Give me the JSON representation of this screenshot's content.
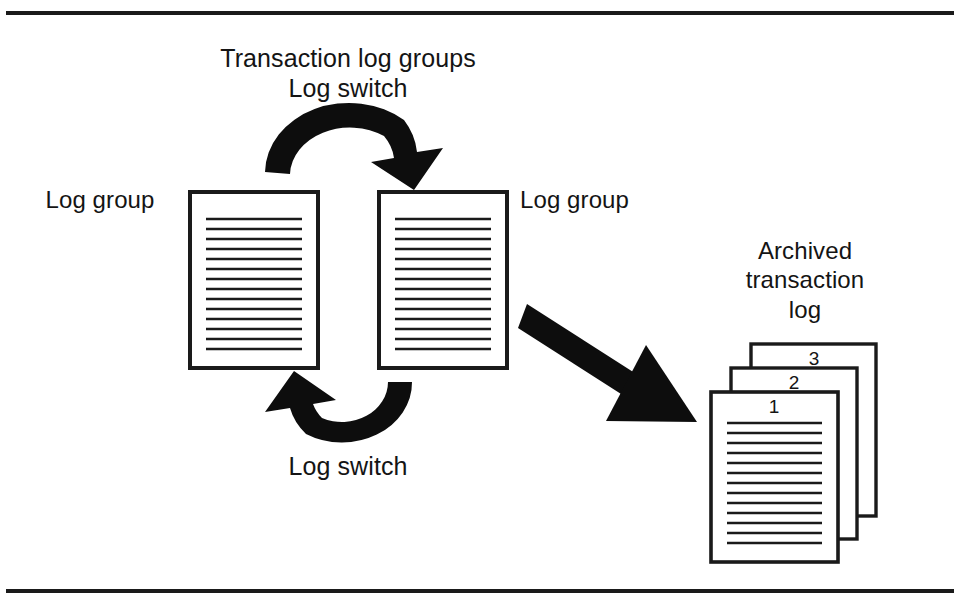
{
  "figure": {
    "kind": "diagram",
    "title_block": {
      "line1": "Transaction log groups",
      "line2": "Log switch"
    },
    "labels": {
      "log_group_left": "Log group",
      "log_group_right": "Log group",
      "archived_line1": "Archived",
      "archived_line2": "transaction",
      "archived_line3": "log",
      "log_switch_bottom": "Log switch"
    },
    "archived_pages": [
      {
        "number": "3"
      },
      {
        "number": "2"
      },
      {
        "number": "1"
      }
    ],
    "colors": {
      "ink": "#141414",
      "paper": "#ffffff",
      "rule": "#1a1a1a"
    }
  }
}
